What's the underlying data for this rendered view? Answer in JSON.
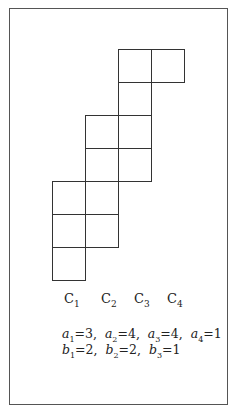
{
  "diagram": {
    "type": "staircase-grid",
    "grid": {
      "origin_x": 52,
      "origin_y": 49,
      "cell_size": 33,
      "cells": [
        {
          "col": 3,
          "row": 1
        },
        {
          "col": 4,
          "row": 1
        },
        {
          "col": 3,
          "row": 2
        },
        {
          "col": 2,
          "row": 3
        },
        {
          "col": 3,
          "row": 3
        },
        {
          "col": 2,
          "row": 4
        },
        {
          "col": 3,
          "row": 4
        },
        {
          "col": 1,
          "row": 5
        },
        {
          "col": 2,
          "row": 5
        },
        {
          "col": 1,
          "row": 6
        },
        {
          "col": 2,
          "row": 6
        },
        {
          "col": 1,
          "row": 7
        }
      ]
    },
    "columns": [
      {
        "name": "C",
        "sub": "1"
      },
      {
        "name": "C",
        "sub": "2"
      },
      {
        "name": "C",
        "sub": "3"
      },
      {
        "name": "C",
        "sub": "4"
      }
    ],
    "equations": {
      "a": [
        {
          "var": "a",
          "sub": "1",
          "val": "=3,"
        },
        {
          "var": "a",
          "sub": "2",
          "val": "=4,"
        },
        {
          "var": "a",
          "sub": "3",
          "val": "=4,"
        },
        {
          "var": "a",
          "sub": "4",
          "val": "=1"
        }
      ],
      "b": [
        {
          "var": "b",
          "sub": "1",
          "val": "=2,"
        },
        {
          "var": "b",
          "sub": "2",
          "val": "=2,"
        },
        {
          "var": "b",
          "sub": "3",
          "val": "=1"
        }
      ]
    }
  }
}
